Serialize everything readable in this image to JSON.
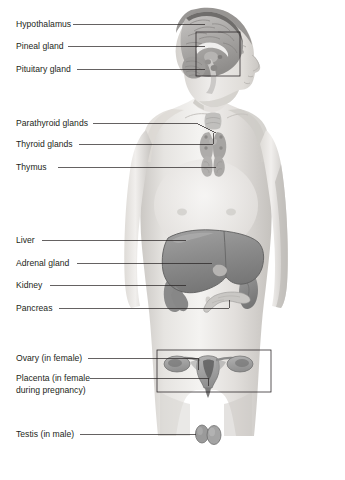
{
  "figure": {
    "background_color": "#ffffff",
    "width": 345,
    "height": 480,
    "label_color": "#231f20",
    "leader_color": "#231f20"
  },
  "labels": [
    {
      "id": "hypothalamus",
      "text": "Hypothalamus",
      "x": 16,
      "y": 27,
      "leader": {
        "x1": 73,
        "y1": 24,
        "x2": 205,
        "y2": 24
      }
    },
    {
      "id": "pineal-gland",
      "text": "Pineal gland",
      "x": 16,
      "y": 49,
      "leader": {
        "x1": 68,
        "y1": 46,
        "x2": 205,
        "y2": 46
      }
    },
    {
      "id": "pituitary-gland",
      "text": "Pituitary gland",
      "x": 16,
      "y": 72,
      "leader": {
        "x1": 77,
        "y1": 69,
        "x2": 205,
        "y2": 69
      }
    },
    {
      "id": "parathyroid-glands",
      "text": "Parathyroid glands",
      "x": 16,
      "y": 126,
      "leader": {
        "x1": 93,
        "y1": 123,
        "x2": 216,
        "y2": 131
      }
    },
    {
      "id": "thyroid-glands",
      "text": "Thyroid glands",
      "x": 16,
      "y": 147,
      "leader": {
        "x1": 79,
        "y1": 144,
        "x2": 224,
        "y2": 144
      }
    },
    {
      "id": "thymus",
      "text": "Thymus",
      "x": 16,
      "y": 170,
      "leader": {
        "x1": 58,
        "y1": 167,
        "x2": 219,
        "y2": 167
      }
    },
    {
      "id": "liver",
      "text": "Liver",
      "x": 16,
      "y": 243,
      "leader": {
        "x1": 42,
        "y1": 240,
        "x2": 186,
        "y2": 240
      }
    },
    {
      "id": "adrenal-gland",
      "text": "Adrenal gland",
      "x": 16,
      "y": 266,
      "leader": {
        "x1": 77,
        "y1": 263,
        "x2": 212,
        "y2": 263
      }
    },
    {
      "id": "kidney",
      "text": "Kidney",
      "x": 16,
      "y": 288,
      "leader": {
        "x1": 50,
        "y1": 285,
        "x2": 188,
        "y2": 285
      }
    },
    {
      "id": "pancreas",
      "text": "Pancreas",
      "x": 16,
      "y": 311,
      "leader": {
        "x1": 59,
        "y1": 308,
        "x2": 229,
        "y2": 308
      }
    },
    {
      "id": "ovary",
      "text": "Ovary (in female)",
      "x": 16,
      "y": 361,
      "leader": {
        "x1": 88,
        "y1": 358,
        "x2": 198,
        "y2": 358
      }
    },
    {
      "id": "placenta",
      "text": "Placenta (in female",
      "x": 16,
      "y": 381,
      "leader": {
        "x1": 90,
        "y1": 378,
        "x2": 205,
        "y2": 378
      }
    },
    {
      "id": "placenta-line2",
      "text": "during pregnancy)",
      "x": 16,
      "y": 393,
      "leader": null
    },
    {
      "id": "testis",
      "text": "Testis (in male)",
      "x": 16,
      "y": 437,
      "leader": {
        "x1": 80,
        "y1": 434,
        "x2": 215,
        "y2": 434
      }
    }
  ],
  "callouts": [
    {
      "id": "brain-callout",
      "x": 196,
      "y": 32,
      "width": 44,
      "height": 44
    },
    {
      "id": "pelvis-callout",
      "x": 157,
      "y": 350,
      "width": 114,
      "height": 42
    }
  ],
  "organs": [
    {
      "id": "brain",
      "name": "brain-sagittal-section"
    },
    {
      "id": "thyroid",
      "name": "thyroid-gland"
    },
    {
      "id": "thymus-organ",
      "name": "thymus-gland"
    },
    {
      "id": "liver-organ",
      "name": "liver"
    },
    {
      "id": "kidney-organ",
      "name": "kidney"
    },
    {
      "id": "pancreas-organ",
      "name": "pancreas"
    },
    {
      "id": "uterus-organ",
      "name": "uterus-and-ovaries"
    },
    {
      "id": "testes-organ",
      "name": "testes"
    }
  ],
  "colors": {
    "skin_light": "#f2f1ef",
    "skin_mid": "#dedcd9",
    "skin_shadow": "#c2bfbb",
    "organ_gray": "#8d8d8d",
    "organ_dark": "#6e6e6e",
    "organ_light": "#a9a9a9",
    "outline": "#4a4a4a"
  }
}
